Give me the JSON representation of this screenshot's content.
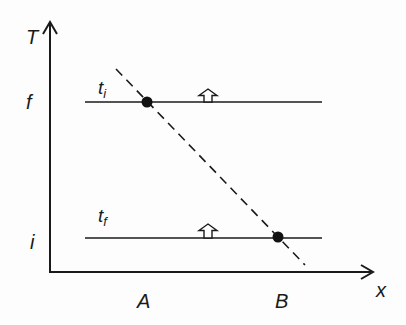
{
  "diagram": {
    "axes": {
      "y_label": "T",
      "x_label": "x",
      "y_ticks": [
        {
          "label": "f",
          "y": 102
        },
        {
          "label": "i",
          "y": 238
        }
      ],
      "x_ticks": [
        {
          "label": "A",
          "x": 147
        },
        {
          "label": "B",
          "x": 278
        }
      ]
    },
    "lines": [
      {
        "label": "t",
        "subscript": "i",
        "y": 102
      },
      {
        "label": "t",
        "subscript": "f",
        "y": 238
      }
    ],
    "colors": {
      "ink": "#1a1a1a",
      "background": "#fdfdfd"
    }
  }
}
